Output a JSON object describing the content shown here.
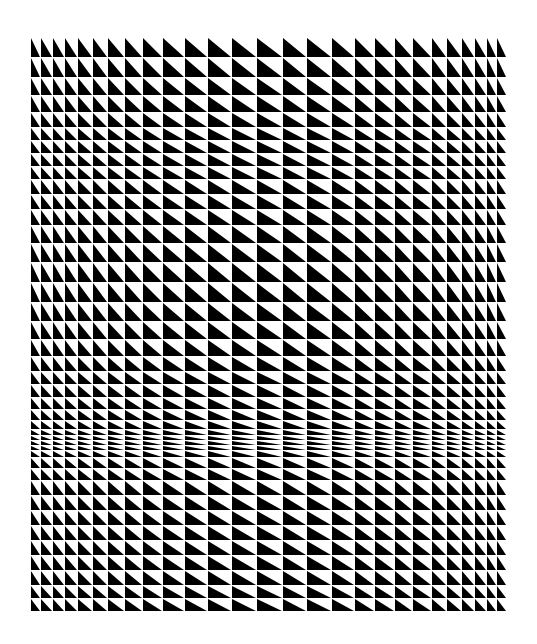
{
  "artwork": {
    "title": "Op-art triangle grid",
    "background": "#ffffff",
    "ink": "#000000",
    "grid_line": "#ffffff",
    "triangle_orientation": "black lower-left, diagonal from top-left to bottom-right",
    "column_edges": [
      31,
      41,
      53,
      65,
      78,
      93,
      108,
      125,
      143,
      163,
      185,
      208,
      232,
      257,
      283,
      307,
      332,
      355,
      375,
      395,
      413,
      432,
      447,
      462,
      475,
      487,
      497,
      507
    ],
    "row_edges": [
      38,
      58,
      78,
      96,
      113,
      128,
      141,
      154,
      167,
      180,
      195,
      210,
      226,
      244,
      263,
      283,
      303,
      322,
      340,
      357,
      372,
      385,
      398,
      410,
      421,
      430,
      436,
      441,
      446,
      451,
      458,
      469,
      481,
      496,
      511,
      526,
      541,
      556,
      571,
      586,
      599,
      612
    ]
  }
}
